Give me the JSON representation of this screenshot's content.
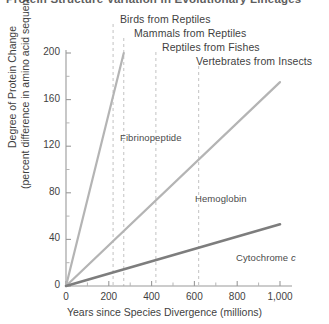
{
  "title": "Protein Structure Variation in Evolutionary Lineages",
  "chart_data": {
    "type": "line",
    "title": "Protein Structure Variation in Evolutionary Lineages",
    "xlabel": "Years since Species Divergence (millions)",
    "ylabel_line1": "Degree of Protein Change",
    "ylabel_line2": "(percent difference in amino acid sequence)",
    "xlim": [
      0,
      1000
    ],
    "ylim": [
      0,
      200
    ],
    "xticks": [
      0,
      200,
      400,
      600,
      800,
      1000
    ],
    "xtick_labels": [
      "0",
      "200",
      "400",
      "600",
      "800",
      "1,000"
    ],
    "xticks_minor": [
      100,
      300,
      500,
      700,
      900
    ],
    "yticks": [
      0,
      40,
      80,
      120,
      160,
      200
    ],
    "ytick_labels": [
      "0",
      "40",
      "80",
      "120",
      "160",
      "200"
    ],
    "grid": false,
    "legend": "inline-labels",
    "series": [
      {
        "name": "Fibrinopeptide",
        "color": "#b4b4b4",
        "width": 2.2,
        "points": [
          [
            0,
            0
          ],
          [
            270,
            200
          ]
        ],
        "label_x": 120,
        "label_y": 132
      },
      {
        "name": "Hemoglobin",
        "color": "#b4b4b4",
        "width": 2.2,
        "points": [
          [
            0,
            0
          ],
          [
            1000,
            175
          ]
        ],
        "label_x": 195,
        "label_y": 193
      },
      {
        "name": "Cytochrome c",
        "color": "#7d7d7d",
        "width": 2.6,
        "points": [
          [
            0,
            0
          ],
          [
            1000,
            53
          ]
        ],
        "label_x": 236,
        "label_y": 252
      }
    ],
    "annotations": [
      {
        "label": "Birds from Reptiles",
        "x": 220,
        "dash_top": 24,
        "dash_bottom": 286,
        "text_x": 120,
        "text_y": 13
      },
      {
        "label": "Mammals from Reptiles",
        "x": 270,
        "dash_top": 38,
        "dash_bottom": 286,
        "text_x": 134,
        "text_y": 27
      },
      {
        "label": "Reptiles from Fishes",
        "x": 420,
        "dash_top": 52,
        "dash_bottom": 286,
        "text_x": 162,
        "text_y": 41
      },
      {
        "label": "Vertebrates from Insects",
        "x": 620,
        "dash_top": 66,
        "dash_bottom": 286,
        "text_x": 196,
        "text_y": 55
      }
    ]
  }
}
